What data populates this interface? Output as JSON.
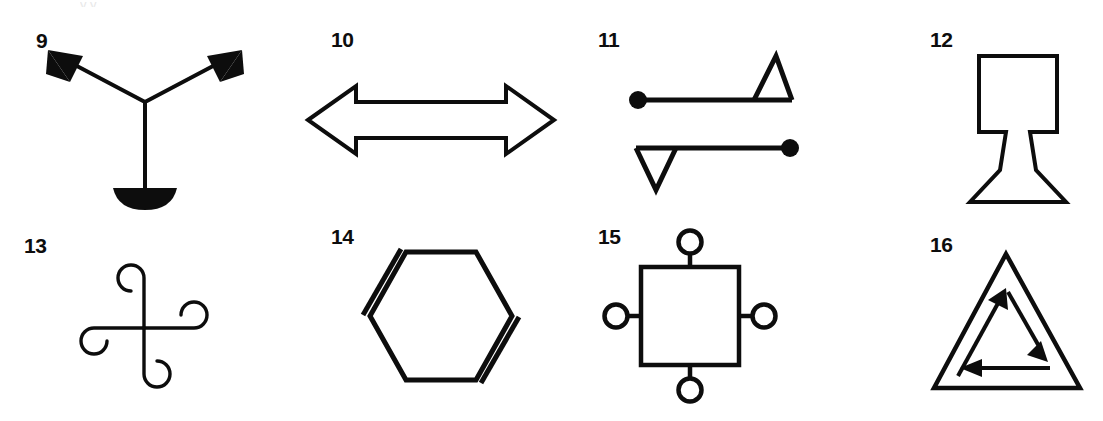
{
  "page": {
    "background_color": "#ffffff",
    "ink_color": "#0d0d0d",
    "width": 1103,
    "height": 421,
    "top_bleed_text": "y         y"
  },
  "figures": [
    {
      "id": "fig-9",
      "label": "9",
      "label_x": 36,
      "label_y": 30,
      "name": "figure-9-y-arrows-with-crescent",
      "description": "Y shape with two filled arrowheads on upper arms and a filled crescent at the foot",
      "art_x": 28,
      "art_y": 44,
      "art_w": 236,
      "art_h": 166
    },
    {
      "id": "fig-10",
      "label": "10",
      "label_x": 331,
      "label_y": 29,
      "name": "figure-10-double-headed-arrow",
      "description": "Hollow outlined double-headed horizontal arrow",
      "art_x": 300,
      "art_y": 78,
      "art_w": 262,
      "art_h": 84
    },
    {
      "id": "fig-11",
      "label": "11",
      "label_x": 598,
      "label_y": 29,
      "name": "figure-11-dot-line-triangle-pair",
      "description": "Two mirrored elements: a line with a filled dot at one end and an open triangle at the other",
      "art_x": 620,
      "art_y": 48,
      "art_w": 200,
      "art_h": 148
    },
    {
      "id": "fig-12",
      "label": "12",
      "label_x": 930,
      "label_y": 29,
      "name": "figure-12-lamp-outline",
      "description": "Outline of a lamp: square top, narrow stem, flared trapezoidal base",
      "art_x": 962,
      "art_y": 48,
      "art_w": 112,
      "art_h": 162
    },
    {
      "id": "fig-13",
      "label": "13",
      "label_x": 24,
      "label_y": 235,
      "name": "figure-13-curled-cross-pinwheel",
      "description": "Cross whose four arms each end in a spiral curl, rotationally symmetric",
      "art_x": 66,
      "art_y": 248,
      "art_w": 156,
      "art_h": 156
    },
    {
      "id": "fig-14",
      "label": "14",
      "label_x": 331,
      "label_y": 226,
      "name": "figure-14-hexagon-two-double-bonds",
      "description": "Hexagon with doubled lines on the upper-left and lower-right edges",
      "art_x": 348,
      "art_y": 238,
      "art_w": 186,
      "art_h": 156
    },
    {
      "id": "fig-15",
      "label": "15",
      "label_x": 598,
      "label_y": 226,
      "name": "figure-15-square-with-four-circles",
      "description": "Square with a small circle attached by a short stub at the midpoint of each side",
      "art_x": 600,
      "art_y": 226,
      "art_w": 180,
      "art_h": 180
    },
    {
      "id": "fig-16",
      "label": "16",
      "label_x": 930,
      "label_y": 234,
      "name": "figure-16-triangle-with-cyclic-arrows",
      "description": "Triangle outline containing an inner triangle of three arrows forming a cycle",
      "art_x": 928,
      "art_y": 248,
      "art_w": 162,
      "art_h": 150
    }
  ]
}
